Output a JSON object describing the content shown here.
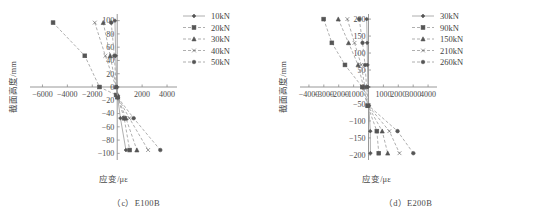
{
  "figure": {
    "panels": [
      {
        "id": "panel-c",
        "caption": "（c）E100B",
        "xlabel": "应变/με",
        "ylabel": "截面高度/mm",
        "chart_data": {
          "type": "line",
          "title": "(c) E100B",
          "xlabel": "应变/με",
          "ylabel": "截面高度/mm",
          "xlim": [
            -7000,
            4800
          ],
          "ylim": [
            -110,
            110
          ],
          "xticks": [
            -6000,
            -4000,
            -2000,
            0,
            2000,
            4000
          ],
          "xticklabels": [
            "-6000",
            "-4000",
            "-2000",
            "0",
            "2000",
            "4000"
          ],
          "yticks": [
            100,
            80,
            60,
            40,
            20,
            0,
            -20,
            -40,
            -60,
            -80,
            -100
          ],
          "yticklabels": [
            "100",
            "80",
            "60",
            "40",
            "20",
            "0",
            "-20",
            "-40",
            "-60",
            "-80",
            "-100"
          ],
          "grid": false,
          "legend_position": "upper-right",
          "series": [
            {
              "name": "10kN",
              "marker": "diamond",
              "linestyle": "solid",
              "x": [
                -180,
                -120,
                -30,
                10,
                260,
                700
              ],
              "y": [
                100,
                47,
                0,
                -12,
                -47,
                -95
              ]
            },
            {
              "name": "20kN",
              "marker": "square",
              "linestyle": "dashed",
              "x": [
                -5150,
                -2600,
                -1420,
                -90,
                30,
                560,
                1000
              ],
              "y": [
                97,
                47,
                0,
                -12,
                -15,
                -47,
                -95
              ]
            },
            {
              "name": "30kN",
              "marker": "triangle",
              "linestyle": "dashed",
              "x": [
                -1120,
                -560,
                -90,
                40,
                700,
                1580
              ],
              "y": [
                97,
                47,
                0,
                -15,
                -47,
                -95
              ]
            },
            {
              "name": "40kN",
              "marker": "cross",
              "linestyle": "dashed",
              "x": [
                -1800,
                -950,
                -100,
                50,
                980,
                2480
              ],
              "y": [
                97,
                47,
                0,
                -16,
                -47,
                -95
              ]
            },
            {
              "name": "50kN",
              "marker": "circle",
              "linestyle": "dashed",
              "x": [
                -480,
                -230,
                -80,
                60,
                1320,
                3460
              ],
              "y": [
                97,
                47,
                0,
                -16,
                -47,
                -95
              ]
            }
          ]
        },
        "legend": [
          {
            "label": "10kN",
            "marker": "diamond",
            "linestyle": "solid"
          },
          {
            "label": "20kN",
            "marker": "square",
            "linestyle": "dashed"
          },
          {
            "label": "30kN",
            "marker": "triangle",
            "linestyle": "dashed"
          },
          {
            "label": "40kN",
            "marker": "cross",
            "linestyle": "dashed"
          },
          {
            "label": "50kN",
            "marker": "circle",
            "linestyle": "dashed"
          }
        ]
      },
      {
        "id": "panel-d",
        "caption": "（d）E200B",
        "xlabel": "应变/με",
        "ylabel": "截面高度/mm",
        "chart_data": {
          "type": "line",
          "title": "(d) E200B",
          "xlabel": "应变/με",
          "ylabel": "截面高度/mm",
          "xlim": [
            -4600,
            4600
          ],
          "ylim": [
            -215,
            215
          ],
          "xticks": [
            -4000,
            -3000,
            -2000,
            -1000,
            0,
            1000,
            2000,
            3000,
            4000
          ],
          "xticklabels": [
            "-4000",
            "-3000",
            "-2000",
            "-1000",
            "0",
            "1000",
            "2000",
            "3000",
            "4000"
          ],
          "yticks": [
            200,
            150,
            100,
            50,
            0,
            -50,
            -100,
            -150,
            -200
          ],
          "yticklabels": [
            "200",
            "150",
            "100",
            "50",
            "0",
            "-50",
            "-100",
            "-150",
            "-200"
          ],
          "grid": false,
          "legend_position": "upper-right",
          "series": [
            {
              "name": "30kN",
              "marker": "diamond",
              "linestyle": "solid",
              "x": [
                -120,
                -90,
                -70,
                -40,
                20,
                120,
                130
              ],
              "y": [
                200,
                130,
                65,
                0,
                -55,
                -130,
                -195
              ]
            },
            {
              "name": "90kN",
              "marker": "square",
              "linestyle": "dashed",
              "x": [
                -3010,
                -2460,
                -1580,
                -420,
                -60,
                560,
                690
              ],
              "y": [
                200,
                130,
                65,
                0,
                -55,
                -130,
                -195
              ]
            },
            {
              "name": "150kN",
              "marker": "triangle",
              "linestyle": "dashed",
              "x": [
                -2030,
                -1340,
                -700,
                -330,
                -40,
                920,
                1290
              ],
              "y": [
                200,
                130,
                65,
                0,
                -55,
                -130,
                -195
              ]
            },
            {
              "name": "210kN",
              "marker": "cross",
              "linestyle": "dashed",
              "x": [
                -1420,
                -940,
                -490,
                -240,
                -20,
                1400,
                2080
              ],
              "y": [
                200,
                130,
                65,
                0,
                -55,
                -130,
                -195
              ]
            },
            {
              "name": "260kN",
              "marker": "circle",
              "linestyle": "dashed",
              "x": [
                -620,
                -400,
                -230,
                -130,
                10,
                1950,
                3010
              ],
              "y": [
                200,
                130,
                65,
                0,
                -55,
                -130,
                -195
              ]
            }
          ]
        },
        "legend": [
          {
            "label": "30kN",
            "marker": "diamond",
            "linestyle": "solid"
          },
          {
            "label": "90kN",
            "marker": "square",
            "linestyle": "dashed"
          },
          {
            "label": "150kN",
            "marker": "triangle",
            "linestyle": "dashed"
          },
          {
            "label": "210kN",
            "marker": "cross",
            "linestyle": "dashed"
          },
          {
            "label": "260kN",
            "marker": "circle",
            "linestyle": "dashed"
          }
        ]
      }
    ],
    "colors": {
      "axis": "#8d8d8d",
      "text": "#4a4a4a",
      "series": "#9a9a9a",
      "marker": "#555555"
    }
  }
}
